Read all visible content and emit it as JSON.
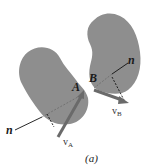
{
  "diagram": {
    "caption": "(a)",
    "bodies": [
      {
        "name": "body-A",
        "point_label": "A",
        "velocity_label": "v",
        "velocity_subscript": "A",
        "normal_label": "n"
      },
      {
        "name": "body-B",
        "point_label": "B",
        "velocity_label": "v",
        "velocity_subscript": "B",
        "normal_label": "n"
      }
    ],
    "colors": {
      "body_fill": "#8e8e8e",
      "arrow": "#6a6a6a",
      "line": "#111111"
    }
  }
}
